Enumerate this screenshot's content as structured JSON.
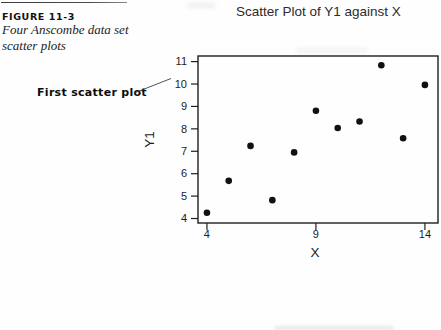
{
  "figure": {
    "label": "FIGURE 11-3",
    "caption_line1": "Four Anscombe data set",
    "caption_line2": "scatter plots",
    "annotation": "First scatter plot"
  },
  "chart_data": {
    "type": "scatter",
    "title": "Scatter Plot of Y1 against X",
    "xlabel": "X",
    "ylabel": "Y1",
    "xlim": [
      3.59,
      14.6
    ],
    "ylim": [
      3.8,
      11.25
    ],
    "xticks": [
      4,
      9,
      14
    ],
    "yticks": [
      4,
      5,
      6,
      7,
      8,
      9,
      10,
      11
    ],
    "grid": false,
    "legend": null,
    "marker_color": "#111111",
    "axis_color": "#1f1f1f",
    "points": [
      {
        "x": 10,
        "y": 8.04
      },
      {
        "x": 8,
        "y": 6.95
      },
      {
        "x": 13,
        "y": 7.58
      },
      {
        "x": 9,
        "y": 8.81
      },
      {
        "x": 11,
        "y": 8.33
      },
      {
        "x": 14,
        "y": 9.96
      },
      {
        "x": 6,
        "y": 7.24
      },
      {
        "x": 4,
        "y": 4.26
      },
      {
        "x": 12,
        "y": 10.84
      },
      {
        "x": 7,
        "y": 4.82
      },
      {
        "x": 5,
        "y": 5.68
      }
    ]
  }
}
